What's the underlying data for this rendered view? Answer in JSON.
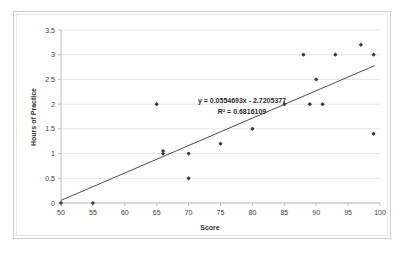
{
  "chart_data": {
    "type": "scatter",
    "title": "",
    "xlabel": "Score",
    "ylabel": "Hours of Practice",
    "xlim": [
      50,
      100
    ],
    "ylim": [
      0,
      3.5
    ],
    "xticks": [
      50,
      55,
      60,
      65,
      70,
      75,
      80,
      85,
      90,
      95,
      100
    ],
    "xtick_labels": [
      "50",
      "55",
      "60",
      "65",
      "70",
      "75",
      "80",
      "85",
      "90",
      "95",
      "100"
    ],
    "yticks": [
      0,
      0.5,
      1,
      1.5,
      2,
      2.5,
      3,
      3.5
    ],
    "ytick_labels": [
      "0",
      "0.5",
      "1",
      "1.5",
      "2",
      "2.5",
      "3",
      "3.5"
    ],
    "grid": "horizontal",
    "legend": "none",
    "points": [
      {
        "x": 50,
        "y": 0
      },
      {
        "x": 55,
        "y": 0
      },
      {
        "x": 65,
        "y": 2
      },
      {
        "x": 66,
        "y": 1
      },
      {
        "x": 66,
        "y": 1.05
      },
      {
        "x": 70,
        "y": 1
      },
      {
        "x": 70,
        "y": 0.5
      },
      {
        "x": 75,
        "y": 1.2
      },
      {
        "x": 80,
        "y": 1.5
      },
      {
        "x": 85,
        "y": 2
      },
      {
        "x": 88,
        "y": 3
      },
      {
        "x": 89,
        "y": 2
      },
      {
        "x": 90,
        "y": 2.5
      },
      {
        "x": 91,
        "y": 2
      },
      {
        "x": 93,
        "y": 3
      },
      {
        "x": 97,
        "y": 3.2
      },
      {
        "x": 99,
        "y": 3
      },
      {
        "x": 99,
        "y": 1.4
      }
    ],
    "trendline": {
      "slope": 0.0554693,
      "intercept": -2.7205377,
      "x_start": 50,
      "x_end": 99.2,
      "equation_label": "y = 0.0554693x - 2.7205377",
      "r2_label": "R² = 0.6816109"
    },
    "colors": {
      "point": "#3d3d3d",
      "trendline": "#3a3a3a",
      "gridline": "#d9d9d9",
      "axis": "#b0b0b0",
      "text": "#404040",
      "background": "#ffffff",
      "frame": "#cfcfcf"
    }
  }
}
